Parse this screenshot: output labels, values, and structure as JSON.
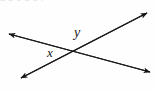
{
  "figure": {
    "name": "intersecting-lines-angle-diagram",
    "background_color": "#fefefe",
    "line_color": "#1a1a1a",
    "label_color": "#1a1a1a",
    "width": 156,
    "height": 91
  },
  "cropped_text_above": {
    "text": "a   b     c       d      e     f"
  },
  "labels": [
    {
      "id": "y",
      "text": "y",
      "position": "above-intersection",
      "x": 80,
      "y": 33
    },
    {
      "id": "x",
      "text": "x",
      "position": "left-of-intersection",
      "x": 52,
      "y": 52
    }
  ],
  "lines": [
    {
      "id": "line-falling",
      "description": "line from upper-left to lower-right",
      "start": {
        "x": 8,
        "y": 34
      },
      "end": {
        "x": 150,
        "y": 72
      },
      "arrow_start": true,
      "arrow_end": true
    },
    {
      "id": "line-rising",
      "description": "line from lower-left to upper-right",
      "start": {
        "x": 20,
        "y": 79
      },
      "end": {
        "x": 148,
        "y": 12
      },
      "arrow_start": true,
      "arrow_end": true
    }
  ],
  "intersection": {
    "x": 76,
    "y": 51
  }
}
